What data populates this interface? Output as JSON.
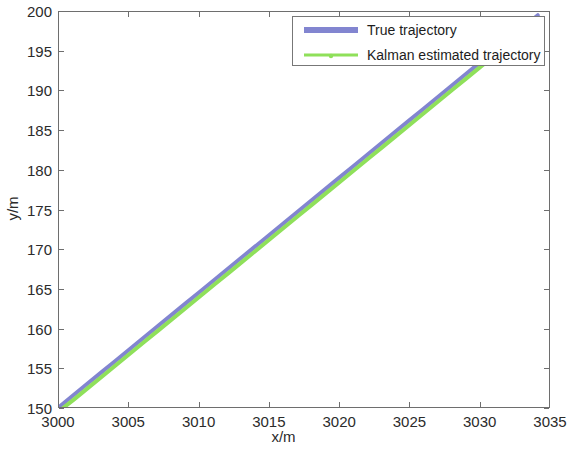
{
  "chart_data": {
    "type": "line",
    "title": "",
    "xlabel": "x/m",
    "ylabel": "y/m",
    "xlim": [
      3000,
      3035
    ],
    "ylim": [
      150,
      200
    ],
    "xticks": [
      3000,
      3005,
      3010,
      3015,
      3020,
      3025,
      3030,
      3035
    ],
    "xtick_labels": [
      "3000",
      "3005",
      "3010",
      "3015",
      "3020",
      "3025",
      "3030",
      "3035"
    ],
    "yticks": [
      150,
      155,
      160,
      165,
      170,
      175,
      180,
      185,
      190,
      195,
      200
    ],
    "ytick_labels": [
      "150",
      "155",
      "160",
      "165",
      "170",
      "175",
      "180",
      "185",
      "190",
      "195",
      "200"
    ],
    "grid": false,
    "legend_position": "upper right",
    "box": true,
    "tick_direction": "in",
    "series": [
      {
        "name": "True trajectory",
        "color": "#8285d0",
        "linewidth": 4,
        "marker": "none",
        "x": [
          3000.0,
          3001.0,
          3002.0,
          3003.0,
          3004.0,
          3005.0,
          3006.0,
          3007.0,
          3008.0,
          3009.0,
          3010.0,
          3011.0,
          3012.0,
          3013.0,
          3014.0,
          3015.0,
          3016.0,
          3017.0,
          3018.0,
          3019.0,
          3020.0,
          3021.0,
          3022.0,
          3023.0,
          3024.0,
          3025.0,
          3026.0,
          3027.0,
          3028.0,
          3029.0,
          3030.0,
          3031.0,
          3032.0,
          3033.0,
          3034.2
        ],
        "y": [
          150.0,
          151.45,
          152.9,
          154.35,
          155.8,
          157.25,
          158.7,
          160.15,
          161.6,
          163.05,
          164.5,
          165.95,
          167.4,
          168.85,
          170.3,
          171.75,
          173.2,
          174.65,
          176.1,
          177.55,
          179.0,
          180.45,
          181.9,
          183.35,
          184.8,
          186.25,
          187.7,
          189.15,
          190.6,
          192.05,
          193.5,
          194.95,
          196.4,
          197.85,
          199.6
        ]
      },
      {
        "name": "Kalman estimated trajectory",
        "color": "#8fe05a",
        "linewidth": 4,
        "marker": "point",
        "x": [
          3000.1,
          3001.1,
          3002.1,
          3003.1,
          3004.1,
          3005.1,
          3006.1,
          3007.1,
          3008.1,
          3009.1,
          3010.1,
          3011.1,
          3012.1,
          3013.1,
          3014.1,
          3015.1,
          3016.1,
          3017.1,
          3018.1,
          3019.1,
          3020.1,
          3021.1,
          3022.1,
          3023.1,
          3024.1,
          3025.1,
          3026.1,
          3027.1,
          3028.1,
          3029.1,
          3030.1,
          3031.1,
          3032.1,
          3033.1,
          3034.3
        ],
        "y": [
          149.6,
          151.0,
          152.45,
          153.9,
          155.35,
          156.8,
          158.25,
          159.7,
          161.15,
          162.6,
          164.05,
          165.5,
          166.95,
          168.4,
          169.85,
          171.3,
          172.75,
          174.2,
          175.65,
          177.1,
          178.55,
          180.0,
          181.45,
          182.9,
          184.35,
          185.8,
          187.25,
          188.7,
          190.15,
          191.6,
          193.05,
          194.5,
          195.95,
          197.4,
          199.15
        ]
      }
    ]
  },
  "legend": {
    "entries": [
      {
        "label": "True trajectory"
      },
      {
        "label": "Kalman estimated trajectory"
      }
    ]
  },
  "colors": {
    "true_trajectory": "#8285d0",
    "kalman_trajectory": "#8fe05a",
    "axis": "#6e6e6e",
    "text": "#2b2b2b",
    "background": "#ffffff"
  }
}
